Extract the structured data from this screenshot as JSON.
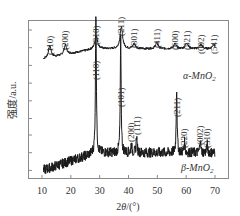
{
  "chart_data": {
    "type": "line",
    "title": "",
    "xlabel": "2θ/(°)",
    "ylabel": "强度/a.u.",
    "xlim": [
      7,
      72
    ],
    "x_ticks": [
      10,
      20,
      30,
      40,
      50,
      60,
      70
    ],
    "y_ticks_count": 6,
    "grid": false,
    "legend_position": "inline-right",
    "series": [
      {
        "name": "α-MnO2",
        "label_main": "α-MnO",
        "label_sub": "2",
        "baseline_start": 0.55,
        "baseline": 0.72,
        "peaks": [
          {
            "two_theta": 12.7,
            "hkl": "(110)",
            "height": 0.2
          },
          {
            "two_theta": 18.1,
            "hkl": "(200)",
            "height": 0.16
          },
          {
            "two_theta": 28.8,
            "hkl": "(310)",
            "height": 0.22
          },
          {
            "two_theta": 37.5,
            "hkl": "(211)",
            "height": 0.36
          },
          {
            "two_theta": 42.0,
            "hkl": "(301)",
            "height": 0.08
          },
          {
            "two_theta": 49.8,
            "hkl": "(411)",
            "height": 0.1
          },
          {
            "two_theta": 56.1,
            "hkl": "(600)",
            "height": 0.08
          },
          {
            "two_theta": 60.2,
            "hkl": "(521)",
            "height": 0.1
          },
          {
            "two_theta": 65.1,
            "hkl": "(002)",
            "height": 0.07
          },
          {
            "two_theta": 69.5,
            "hkl": "(541)",
            "height": 0.07
          }
        ]
      },
      {
        "name": "β-MnO2",
        "label_main": "β-MnO",
        "label_sub": "2",
        "baseline_start": 0.0,
        "baseline": 0.12,
        "peaks": [
          {
            "two_theta": 28.7,
            "hkl": "(110)",
            "height": 1.0
          },
          {
            "two_theta": 37.3,
            "hkl": "(101)",
            "height": 0.78
          },
          {
            "two_theta": 41.0,
            "hkl": "(200)",
            "height": 0.06
          },
          {
            "two_theta": 42.8,
            "hkl": "(111)",
            "height": 0.12
          },
          {
            "two_theta": 56.7,
            "hkl": "(211)",
            "height": 0.45
          },
          {
            "two_theta": 59.4,
            "hkl": "(220)",
            "height": 0.08
          },
          {
            "two_theta": 64.9,
            "hkl": "(002)",
            "height": 0.1
          },
          {
            "two_theta": 67.3,
            "hkl": "(310)",
            "height": 0.06
          }
        ]
      }
    ]
  },
  "axes": {
    "x_label_prefix": "2",
    "x_label_theta": "θ",
    "x_label_suffix": "/(°)",
    "y_label": "强度/a.u."
  }
}
